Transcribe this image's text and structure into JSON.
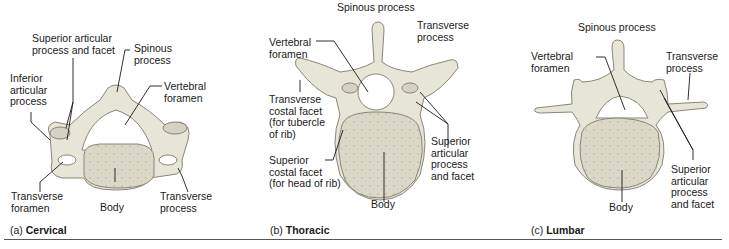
{
  "figure": {
    "panels": [
      {
        "id": "cervical",
        "caption_letter": "(a)",
        "caption": "Cervical",
        "labels": {
          "superior_articular": "Superior articular\nprocess and facet",
          "spinous": "Spinous\nprocess",
          "inferior_articular": "Inferior\narticular\nprocess",
          "vertebral_foramen": "Vertebral\nforamen",
          "transverse_foramen": "Transverse\nforamen",
          "body": "Body",
          "transverse_process": "Transverse\nprocess"
        }
      },
      {
        "id": "thoracic",
        "caption_letter": "(b)",
        "caption": "Thoracic",
        "labels": {
          "spinous": "Spinous process",
          "transverse_process": "Transverse\nprocess",
          "vertebral_foramen": "Vertebral\nforamen",
          "transverse_costal_facet": "Transverse\ncostal facet\n(for tubercle\nof rib)",
          "superior_costal_facet": "Superior\ncostal facet\n(for head of rib)",
          "superior_articular": "Superior\narticular\nprocess\nand facet",
          "body": "Body"
        }
      },
      {
        "id": "lumbar",
        "caption_letter": "(c)",
        "caption": "Lumbar",
        "labels": {
          "spinous": "Spinous process",
          "vertebral_foramen": "Vertebral\nforamen",
          "transverse_process": "Transverse\nprocess",
          "superior_articular": "Superior\narticular\nprocess\nand facet",
          "body": "Body"
        }
      }
    ],
    "colors": {
      "bone": "#e7e4d8",
      "bone_shade": "#c9c5b6",
      "body_fill": "#dcd8c8",
      "outline": "#8a8677",
      "leader": "#1a1a1a"
    }
  }
}
